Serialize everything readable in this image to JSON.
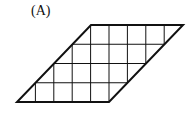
{
  "figure": {
    "label": "(A)",
    "shape": "parallelogram",
    "grid_columns": 5,
    "grid_rows": 4,
    "line_color": "#111111",
    "vertices": {
      "top_left": [
        91,
        25
      ],
      "top_right": [
        183,
        25
      ],
      "bottom_right": [
        109,
        102
      ],
      "bottom_left": [
        17,
        102
      ]
    }
  }
}
